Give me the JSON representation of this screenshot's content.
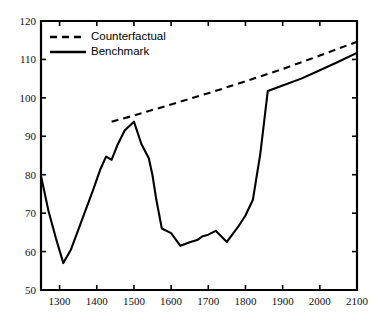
{
  "chart_data": {
    "type": "line",
    "title": "",
    "subtitle": "",
    "xlabel": "",
    "ylabel": "",
    "xlim": [
      1250,
      2100
    ],
    "ylim": [
      50,
      120
    ],
    "xticks": [
      1300,
      1400,
      1500,
      1600,
      1700,
      1800,
      1900,
      2000,
      2100
    ],
    "yticks": [
      50,
      60,
      70,
      80,
      90,
      100,
      110,
      120
    ],
    "xtick_labels": [
      "1300",
      "1400",
      "1500",
      "1600",
      "1700",
      "1800",
      "1900",
      "2000",
      "2100"
    ],
    "ytick_labels": [
      "50",
      "60",
      "70",
      "80",
      "90",
      "100",
      "110",
      "120"
    ],
    "grid": false,
    "legend_position": "top-left",
    "frame": true,
    "tick_direction": "in",
    "series": [
      {
        "name": "Counterfactual",
        "style": "dashed",
        "color": "#000000",
        "x": [
          1440,
          1500,
          1600,
          1700,
          1800,
          1900,
          2000,
          2100
        ],
        "values": [
          93.8,
          95.4,
          98.3,
          101.2,
          104.3,
          107.5,
          111.0,
          114.6
        ]
      },
      {
        "name": "Benchmark",
        "style": "solid",
        "color": "#000000",
        "x": [
          1250,
          1270,
          1290,
          1310,
          1330,
          1360,
          1390,
          1410,
          1425,
          1440,
          1455,
          1475,
          1500,
          1520,
          1540,
          1550,
          1560,
          1575,
          1600,
          1625,
          1650,
          1670,
          1685,
          1700,
          1720,
          1750,
          1780,
          1800,
          1820,
          1840,
          1860,
          1900,
          1950,
          2000,
          2050,
          2100
        ],
        "values": [
          79.7,
          70.6,
          63.5,
          57.0,
          60.4,
          68.2,
          76.0,
          81.5,
          84.7,
          83.9,
          87.6,
          91.5,
          93.8,
          88.0,
          84.3,
          79.8,
          73.6,
          66.0,
          64.8,
          61.5,
          62.4,
          63.0,
          64.0,
          64.4,
          65.4,
          62.5,
          66.4,
          69.4,
          73.5,
          85.5,
          101.8,
          103.2,
          105.0,
          107.2,
          109.4,
          111.7
        ]
      }
    ],
    "legend": [
      {
        "label": "Counterfactual",
        "style": "dashed"
      },
      {
        "label": "Benchmark",
        "style": "solid"
      }
    ]
  }
}
